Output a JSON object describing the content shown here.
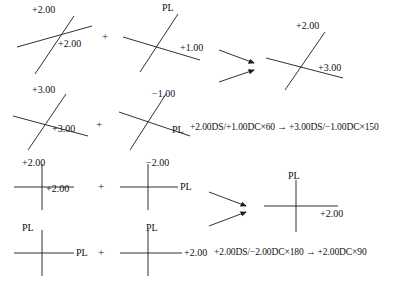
{
  "figure": {
    "type": "optical-cross-transposition-diagram",
    "operator": "+",
    "arrow_glyph": "→",
    "line_color": "#1a1a1a",
    "text_color": "#111111",
    "background": "#ffffff"
  },
  "examples": [
    {
      "id": "example-1",
      "orientation": "oblique",
      "operand_a": {
        "name": "cross-1a",
        "top_label": "+2.00",
        "lower_right_label": "+2.00"
      },
      "operand_b": {
        "name": "cross-1b",
        "top_label": "PL",
        "lower_right_label": "+1.00"
      },
      "result": {
        "name": "cross-1r",
        "top_label": "+2.00",
        "lower_right_label": "+3.00"
      },
      "alt_operand_a": {
        "name": "cross-2a",
        "top_label": "+3.00",
        "lower_right_label": "+3.00"
      },
      "alt_operand_b": {
        "name": "cross-2b",
        "top_label": "−1.00",
        "lower_right_label": "PL"
      },
      "formula": "+2.00DS/+1.00DC×60 → +3.00DS/−1.00DC×150"
    },
    {
      "id": "example-2",
      "orientation": "orthogonal",
      "operand_a": {
        "name": "cross-3a",
        "top_label": "+2.00",
        "right_label": "+2.00"
      },
      "operand_b": {
        "name": "cross-3b",
        "top_label": "−2.00",
        "right_label": "PL"
      },
      "result": {
        "name": "cross-3r",
        "top_label": "PL",
        "right_label": "+2.00"
      },
      "alt_operand_a": {
        "name": "cross-4a",
        "top_label": "PL",
        "right_label": "PL"
      },
      "alt_operand_b": {
        "name": "cross-4b",
        "top_label": "PL",
        "right_label": "+2.00"
      },
      "formula": "+2.00DS/−2.00DC×180 → +2.00DC×90"
    }
  ],
  "operators": {
    "row1_plus": "+",
    "row2_plus": "+",
    "row3_plus": "+",
    "row4_plus": "+"
  }
}
